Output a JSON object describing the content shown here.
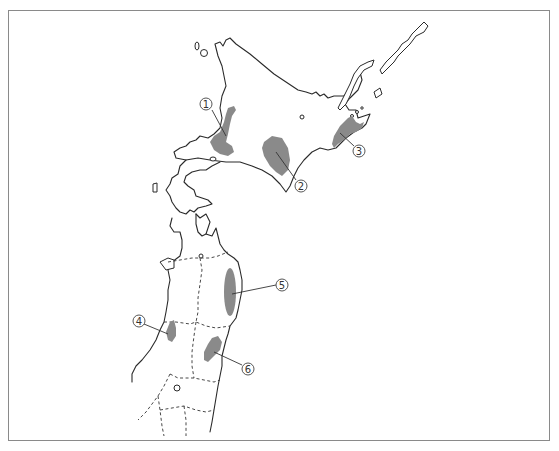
{
  "map": {
    "region_color": "#8a8a8a",
    "frame_color": "#8a8a8a",
    "labels": [
      {
        "id": "1",
        "text": "1",
        "x": 206,
        "y": 104
      },
      {
        "id": "2",
        "text": "2",
        "x": 301,
        "y": 186
      },
      {
        "id": "3",
        "text": "3",
        "x": 359,
        "y": 151
      },
      {
        "id": "4",
        "text": "4",
        "x": 139,
        "y": 321
      },
      {
        "id": "5",
        "text": "5",
        "x": 282,
        "y": 285
      },
      {
        "id": "6",
        "text": "6",
        "x": 248,
        "y": 369
      }
    ]
  }
}
